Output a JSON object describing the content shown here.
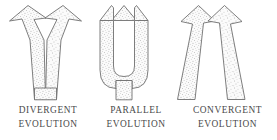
{
  "figure": {
    "background_color": "#ffffff",
    "outline_color": "#6f6f6f",
    "fill_color": "#fbfbfb",
    "stipple_color": "#8d8d8d",
    "text_color": "#4a4a4a"
  },
  "panels": [
    {
      "id": "divergent",
      "icon": "diverging-arrows-v-icon",
      "caption_line1": "DIVERGENT",
      "caption_line2": "EVOLUTION",
      "arrow_count": 2,
      "description": "Two stippled arrows rising and spreading apart from a single common stem, forming a V"
    },
    {
      "id": "parallel",
      "icon": "parallel-arrows-u-icon",
      "caption_line1": "PARALLEL",
      "caption_line2": "EVOLUTION",
      "arrow_count": 2,
      "description": "Two stippled vertical arrows rising side by side from a rounded common base, forming a U"
    },
    {
      "id": "convergent",
      "icon": "converging-arrows-lambda-icon",
      "caption_line1": "CONVERGENT",
      "caption_line2": "EVOLUTION",
      "arrow_count": 2,
      "description": "Two stippled arrows rising and leaning toward each other from separate bases, forming an inverted V"
    }
  ]
}
